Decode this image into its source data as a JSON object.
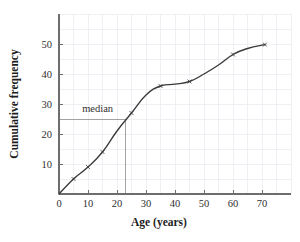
{
  "chart_data": {
    "type": "line",
    "title": "",
    "xlabel": "Age (years)",
    "ylabel": "Cumulative frequency",
    "xlim": [
      0,
      80
    ],
    "ylim": [
      0,
      60
    ],
    "grid": true,
    "grid_step_x": 5,
    "grid_step_y": 5,
    "legend": "none",
    "x_ticks": [
      0,
      10,
      20,
      30,
      40,
      50,
      60,
      70
    ],
    "x_tick_labels": [
      "0",
      "10",
      "20",
      "30",
      "40",
      "50",
      "60",
      "70"
    ],
    "y_ticks": [
      10,
      20,
      30,
      40,
      50
    ],
    "y_tick_labels": [
      "10",
      "20",
      "30",
      "40",
      "50"
    ],
    "series": [
      {
        "name": "Cumulative frequency",
        "x": [
          0,
          5,
          10,
          15,
          20,
          25,
          30,
          35,
          40,
          45,
          50,
          55,
          60,
          65,
          71
        ],
        "values": [
          0,
          5,
          9,
          14,
          21,
          27,
          33,
          36,
          36.6,
          37.5,
          40,
          43,
          46.5,
          48.5,
          49.8
        ]
      }
    ],
    "markers": [
      {
        "x": 5,
        "y": 5
      },
      {
        "x": 10,
        "y": 9
      },
      {
        "x": 15,
        "y": 14
      },
      {
        "x": 25,
        "y": 27
      },
      {
        "x": 35,
        "y": 36
      },
      {
        "x": 45,
        "y": 37.5
      },
      {
        "x": 60,
        "y": 46.5
      },
      {
        "x": 71,
        "y": 49.8
      }
    ],
    "annotations": [
      {
        "name": "median",
        "label": "median",
        "y_value": 25,
        "x_value": 23,
        "label_x": 8,
        "label_y": 27.5
      }
    ],
    "colors": {
      "curve": "#3a3a3a",
      "grid": "#e9e9ef",
      "axis": "#6d6d6d",
      "annotation": "#9a9a9a",
      "background": "#ffffff",
      "text": "#1c1c1c"
    }
  }
}
